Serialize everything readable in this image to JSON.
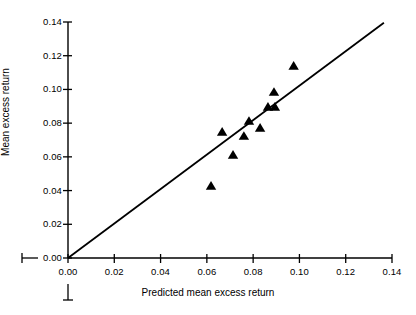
{
  "chart_data": {
    "type": "scatter",
    "title": "",
    "xlabel": "Predicted mean excess return",
    "ylabel": "Mean excess return",
    "xlim": [
      0.0,
      0.14
    ],
    "ylim": [
      0.0,
      0.14
    ],
    "xticks": [
      "0.00",
      "0.02",
      "0.04",
      "0.06",
      "0.08",
      "0.10",
      "0.12",
      "0.14"
    ],
    "yticks": [
      "0.00",
      "0.02",
      "0.04",
      "0.06",
      "0.08",
      "0.10",
      "0.12",
      "0.14"
    ],
    "xtick_values": [
      0.0,
      0.02,
      0.04,
      0.06,
      0.08,
      0.1,
      0.12,
      0.14
    ],
    "ytick_values": [
      0.0,
      0.02,
      0.04,
      0.06,
      0.08,
      0.1,
      0.12,
      0.14
    ],
    "grid": false,
    "legend": false,
    "marker": "triangle-up",
    "marker_color": "#000000",
    "line_color": "#000000",
    "series": [
      {
        "name": "Portfolios",
        "marker": "triangle-up",
        "points": [
          {
            "x": 0.0618,
            "y": 0.0427
          },
          {
            "x": 0.0666,
            "y": 0.0748
          },
          {
            "x": 0.0713,
            "y": 0.0611
          },
          {
            "x": 0.076,
            "y": 0.0723
          },
          {
            "x": 0.0782,
            "y": 0.0812
          },
          {
            "x": 0.083,
            "y": 0.0771
          },
          {
            "x": 0.0864,
            "y": 0.0896
          },
          {
            "x": 0.0894,
            "y": 0.0896
          },
          {
            "x": 0.089,
            "y": 0.0984
          },
          {
            "x": 0.0975,
            "y": 0.1139
          }
        ]
      }
    ],
    "reference_line": {
      "name": "45-degree line",
      "from": {
        "x": 0.0,
        "y": 0.0
      },
      "to": {
        "x": 0.1365,
        "y": 0.1395
      },
      "slope": 1.022,
      "intercept": 0.0
    }
  },
  "axis_marks": {
    "left_stub_label": "",
    "bottom_stub_label": ""
  }
}
